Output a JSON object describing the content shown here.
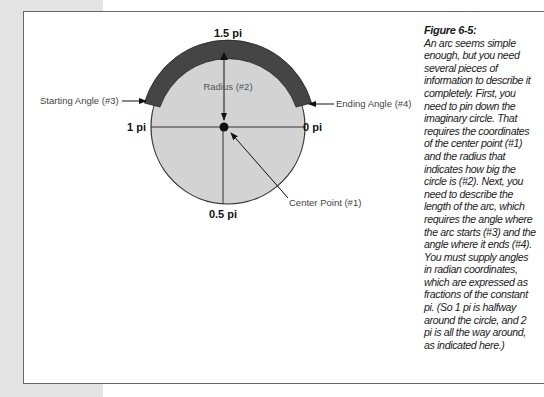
{
  "figure": {
    "title": "Figure 6-5:",
    "caption": "An arc seems simple enough, but you need several pieces of information to describe it completely. First, you need to pin down the imaginary circle. That requires the coordinates of the center point (#1) and the radius that indicates how big the circle is (#2). Next, you need to describe the length of the arc, which requires the angle where the arc starts (#3) and the angle where it ends (#4). You must supply angles in radian coordinates, which are expressed as fractions of the constant pi. (So 1 pi is halfway around the circle, and 2 pi is all the way around, as indicated here.)"
  },
  "diagram": {
    "angle_labels": {
      "top": "1.5 pi",
      "left": "1 pi",
      "right": "0 pi",
      "bottom": "0.5 pi"
    },
    "callouts": {
      "radius": "Radius (#2)",
      "starting_angle": "Starting Angle (#3)",
      "ending_angle": "Ending Angle (#4)",
      "center_point": "Center Point (#1)"
    },
    "colors": {
      "circle_fill": "#d3d3d3",
      "arc_fill": "#454545",
      "lines": "#222222"
    }
  }
}
